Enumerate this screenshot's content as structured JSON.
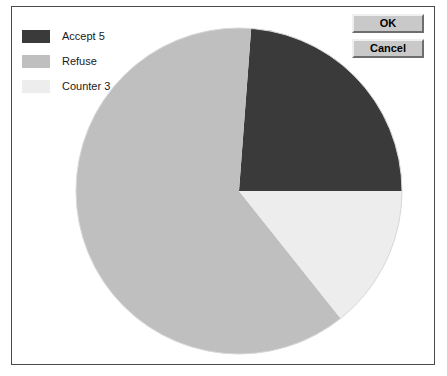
{
  "dialog": {
    "title": "",
    "background_color": "#ffffff",
    "border_color": "#4a4a4a"
  },
  "buttons": {
    "ok_label": "OK",
    "cancel_label": "Cancel",
    "face_color": "#c9c9c9"
  },
  "legend": {
    "position": "top-left",
    "items": [
      {
        "label": "Accept 5",
        "color": "#3a3a3a"
      },
      {
        "label": "Refuse",
        "color": "#bfbfbf"
      },
      {
        "label": "Counter 3",
        "color": "#ededed"
      }
    ]
  },
  "chart_data": {
    "type": "pie",
    "title": "",
    "xlabel": "",
    "ylabel": "",
    "categories": [
      "Accept 5",
      "Refuse",
      "Counter 3"
    ],
    "values": [
      5,
      13,
      3
    ],
    "value_labels": [
      "5",
      "",
      "3"
    ],
    "percentages": [
      23.8,
      61.9,
      14.3
    ],
    "start_angle_deg": 0,
    "direction": "counterclockwise",
    "slice_angles_deg": [
      54,
      153,
      153
    ],
    "colors": [
      "#3a3a3a",
      "#bfbfbf",
      "#ededed"
    ],
    "legend": true,
    "legend_position": "top-left",
    "grid": false,
    "center_px": [
      238,
      190
    ],
    "radius_px": 163
  }
}
